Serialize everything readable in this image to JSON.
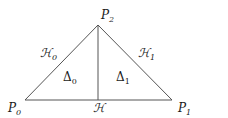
{
  "diagram": {
    "vertices": [
      {
        "id": "P0",
        "label": "P",
        "sub": "0",
        "x": 25,
        "y": 100
      },
      {
        "id": "P1",
        "label": "P",
        "sub": "1",
        "x": 172,
        "y": 100
      },
      {
        "id": "P2",
        "label": "P",
        "sub": "2",
        "x": 98,
        "y": 25
      }
    ],
    "edges": [
      {
        "label": "ℋ",
        "sub": "0",
        "from": "P0",
        "to": "P2"
      },
      {
        "label": "ℋ",
        "sub": "1",
        "from": "P2",
        "to": "P1"
      },
      {
        "label": "ℋ",
        "sub": "",
        "from": "P2",
        "to": "base-midpoint"
      }
    ],
    "regions": [
      {
        "label": "Δ",
        "sub": "0"
      },
      {
        "label": "Δ",
        "sub": "1"
      }
    ],
    "colors": {
      "line": "#555555",
      "text": "#1a1a1a"
    }
  }
}
